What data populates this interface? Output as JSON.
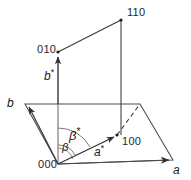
{
  "figure": {
    "type": "crystallographic-axes-diagram",
    "stroke_color": "#3a3a3a",
    "text_color": "#1a1a1a",
    "background": "#ffffff",
    "width": 191,
    "height": 180
  },
  "labels": {
    "origin": "000",
    "point_100": "100",
    "point_010": "010",
    "point_110": "110",
    "axis_a": "a",
    "axis_b": "b",
    "axis_a_star_base": "a",
    "axis_a_star_mark": "*",
    "axis_b_star_base": "b",
    "axis_b_star_mark": "*",
    "angle_beta": "β",
    "angle_beta_star_base": "β",
    "angle_beta_star_mark": "*"
  },
  "geometry": {
    "origin": [
      58,
      164
    ],
    "point_100": [
      117,
      135
    ],
    "point_010": [
      58,
      52
    ],
    "point_110": [
      121,
      20
    ],
    "arrow_a_tip": [
      173,
      160
    ],
    "arrow_b_tip": [
      25,
      104
    ],
    "plane_corner_right": [
      140,
      104
    ],
    "dashed_from": [
      117,
      135
    ],
    "dashed_to": [
      140,
      104
    ]
  },
  "angles": {
    "beta_degrees_arc": "angle between a* and a axes",
    "beta_star_degrees_arc": "angle between a* and b projection"
  }
}
